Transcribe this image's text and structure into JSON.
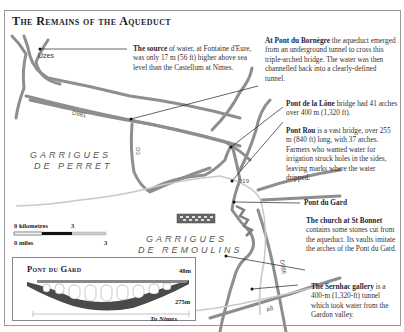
{
  "title": "The Remains of the Aqueduct",
  "places": {
    "uzes": "Uzes",
    "to_nimes": "To Nimes"
  },
  "regions": [
    {
      "line1": "GARRIGUES",
      "line2": "DE PERRET"
    },
    {
      "line1": "GARRIGUES",
      "line2": "DE REMOULINS"
    }
  ],
  "roads": [
    "D981",
    "D3",
    "D19",
    "D986",
    "A9"
  ],
  "annotations": [
    {
      "id": "source",
      "heading": "The source",
      "body": " of water, at Fontaine d'Eure, was only 17 m (56 ft) higher above sea level than the Castellum at Nimes."
    },
    {
      "id": "bornegre",
      "heading": "At Pont du Bornègre",
      "body": " the aqueduct emerged from an underground tunnel to cross this triple-arched bridge. The water was then channelled back into a clearly-defined tunnel."
    },
    {
      "id": "lone",
      "heading": "Pont de la Lône",
      "body": " bridge had 41 arches over 400 m (1,320 ft)."
    },
    {
      "id": "rou",
      "heading": "Pont Rou",
      "body": " is a vast bridge, over 255 m (840 ft) long, with 37 arches. Farmers who wanted water for irrigation struck holes in the sides, leaving marks where the water dripped."
    },
    {
      "id": "gard",
      "heading": "Pont du Gard",
      "body": ""
    },
    {
      "id": "bonnet",
      "heading": "The church at St Bonnet",
      "body": " contains some stones cut from the aqueduct. Its vaults imitate the arches of the Pont du Gard."
    },
    {
      "id": "sernhac",
      "heading": "The Sernhac gallery",
      "body": " is a 400-m (1,320-ft) tunnel which took water from the Gardon valley."
    }
  ],
  "scale": {
    "km_label": "0 kilometres",
    "km_max": "3",
    "miles_label": "0 miles",
    "miles_max": "3"
  },
  "inset": {
    "title": "Pont du Gard",
    "height_label": "48m",
    "length_label": "275m"
  },
  "colors": {
    "river": "#8e8e8e",
    "aqueduct": "#c9c9c9",
    "leader": "#222222",
    "heading": "#1a1f3a"
  }
}
